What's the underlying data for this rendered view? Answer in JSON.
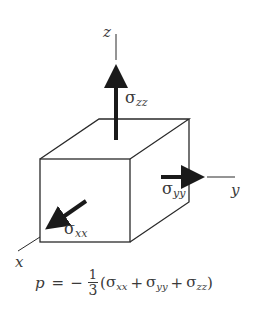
{
  "figure": {
    "axes": {
      "x": {
        "label": "x"
      },
      "y": {
        "label": "y"
      },
      "z": {
        "label": "z"
      }
    },
    "stresses": {
      "sigma_xx": {
        "symbol": "σ",
        "subscript": "xx"
      },
      "sigma_yy": {
        "symbol": "σ",
        "subscript": "yy"
      },
      "sigma_zz": {
        "symbol": "σ",
        "subscript": "zz"
      }
    },
    "equation": {
      "lhs": "p",
      "equals": "=",
      "sign": "−",
      "fraction_numerator": "1",
      "fraction_denominator": "3",
      "open_paren": "(",
      "terms": [
        {
          "symbol": "σ",
          "subscript": "xx"
        },
        {
          "symbol": "σ",
          "subscript": "yy"
        },
        {
          "symbol": "σ",
          "subscript": "zz"
        }
      ],
      "operator": "+",
      "close_paren": ")"
    },
    "colors": {
      "line": "#2a2a2a",
      "arrow": "#1a1a1a",
      "text": "#3a3a3a",
      "background": "#ffffff"
    }
  }
}
